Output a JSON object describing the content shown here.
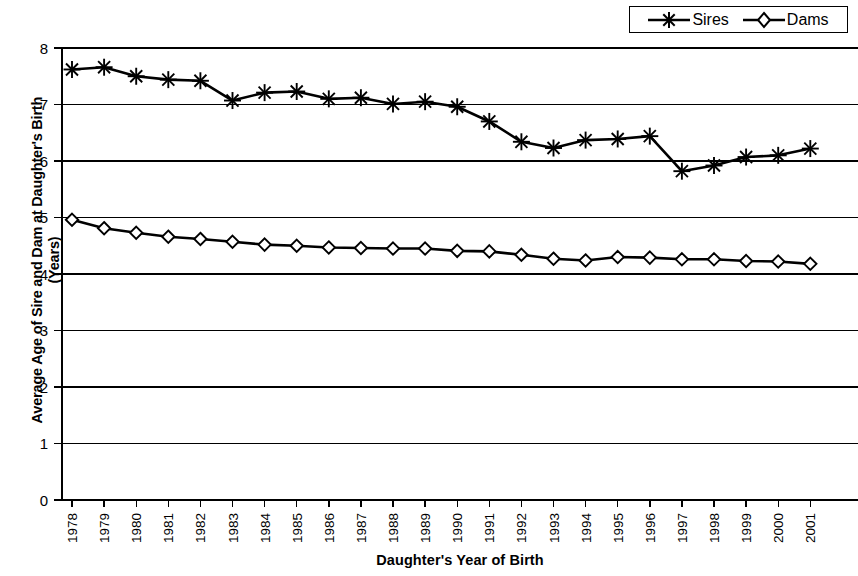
{
  "chart_data": {
    "type": "line",
    "title": "",
    "xlabel": "Daughter's Year of Birth",
    "ylabel": "Average Age of Sire and Dam at Daughter's Birth (Years)",
    "ylabel_line1": "Average Age of Sire and Dam at Daughter's Birth",
    "ylabel_line2": "(Years)",
    "categories": [
      "1978",
      "1979",
      "1980",
      "1981",
      "1982",
      "1983",
      "1984",
      "1985",
      "1986",
      "1987",
      "1988",
      "1989",
      "1990",
      "1991",
      "1992",
      "1993",
      "1994",
      "1995",
      "1996",
      "1997",
      "1998",
      "1999",
      "2000",
      "2001"
    ],
    "x": [
      1978,
      1979,
      1980,
      1981,
      1982,
      1983,
      1984,
      1985,
      1986,
      1987,
      1988,
      1989,
      1990,
      1991,
      1992,
      1993,
      1994,
      1995,
      1996,
      1997,
      1998,
      1999,
      2000,
      2001
    ],
    "series": [
      {
        "name": "Sires",
        "marker": "asterisk",
        "color": "#000000",
        "values": [
          7.62,
          7.66,
          7.5,
          7.44,
          7.42,
          7.07,
          7.21,
          7.23,
          7.1,
          7.12,
          7.01,
          7.05,
          6.96,
          6.7,
          6.34,
          6.23,
          6.37,
          6.39,
          6.44,
          5.82,
          5.92,
          6.07,
          6.1,
          6.22
        ]
      },
      {
        "name": "Dams",
        "marker": "diamond",
        "color": "#000000",
        "values": [
          4.96,
          4.81,
          4.73,
          4.66,
          4.62,
          4.57,
          4.52,
          4.5,
          4.47,
          4.46,
          4.45,
          4.45,
          4.41,
          4.4,
          4.34,
          4.27,
          4.24,
          4.3,
          4.29,
          4.26,
          4.26,
          4.23,
          4.22,
          4.18
        ]
      }
    ],
    "ylim": [
      0,
      8
    ],
    "yticks": [
      0,
      1,
      2,
      3,
      4,
      5,
      6,
      7,
      8
    ],
    "ytick_labels": [
      "0",
      "1",
      "2",
      "3",
      "4",
      "5",
      "6",
      "7",
      "8"
    ],
    "grid": true,
    "grid_axis": "y",
    "legend_position": "top-right",
    "xtick_rotation": -90
  },
  "legend": {
    "entries": [
      {
        "label": "Sires",
        "marker": "asterisk"
      },
      {
        "label": "Dams",
        "marker": "diamond"
      }
    ]
  }
}
